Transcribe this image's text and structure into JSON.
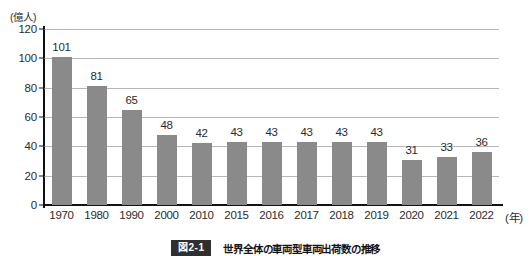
{
  "chart_data": {
    "type": "bar",
    "title": "",
    "xlabel": "(年)",
    "ylabel": "(億人)",
    "ylim": [
      0,
      120
    ],
    "ytick_values": [
      120,
      100,
      80,
      60,
      40,
      20,
      0
    ],
    "grid": true,
    "legend": "none",
    "bar_color": "#8a8a8a",
    "categories": [
      "1970",
      "1980",
      "1990",
      "2000",
      "2010",
      "2015",
      "2016",
      "2017",
      "2018",
      "2019",
      "2020",
      "2021",
      "2022"
    ],
    "values": [
      101,
      81,
      65,
      48,
      42,
      43,
      43,
      43,
      43,
      43,
      31,
      33,
      36
    ],
    "value_labels": [
      "101",
      "81",
      "65",
      "48",
      "42",
      "43",
      "43",
      "43",
      "43",
      "43",
      "31",
      "33",
      "36"
    ]
  },
  "axes": {
    "unit_label": "(億人)",
    "x_axis_title": "(年)",
    "y_ticks": [
      "120",
      "100",
      "80",
      "60",
      "40",
      "20",
      "0"
    ]
  },
  "caption": {
    "badge": "図2-1",
    "text": "世界全体の車両型車両出荷数の推移"
  },
  "colors": {
    "bar": "#8a8a8a",
    "axis": "#111111",
    "grid": "#b7b7b7",
    "text": "#2b2b2b",
    "badge_bg": "#2f2f2f"
  }
}
